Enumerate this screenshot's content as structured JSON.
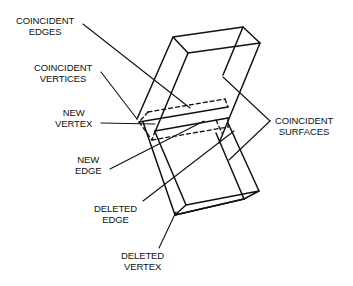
{
  "diagram": {
    "type": "technical line drawing",
    "labels": {
      "coincident_edges": [
        "COINCIDENT",
        "EDGES"
      ],
      "coincident_vertices": [
        "COINCIDENT",
        "VERTICES"
      ],
      "new_vertex": [
        "NEW",
        "VERTEX"
      ],
      "new_edge": [
        "NEW",
        "EDGE"
      ],
      "deleted_edge": [
        "DELETED",
        "EDGE"
      ],
      "deleted_vertex": [
        "DELETED",
        "VERTEX"
      ],
      "coincident_surfaces": [
        "COINCIDENT",
        "SURFACES"
      ]
    },
    "colors": {
      "line": "#111111",
      "background": "#ffffff"
    }
  }
}
